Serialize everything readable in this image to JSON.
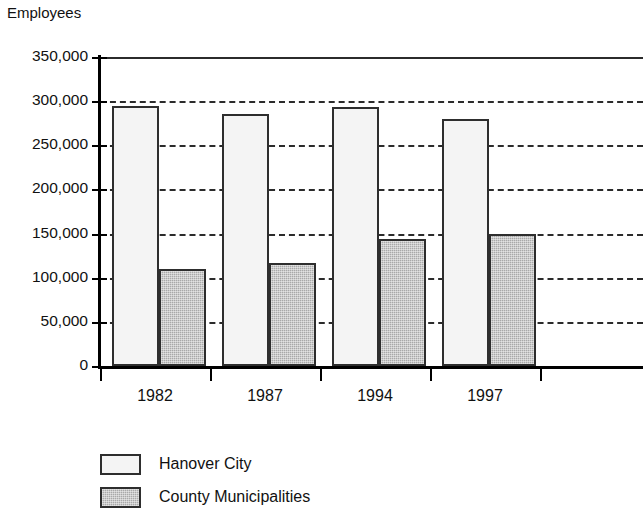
{
  "chart_data": {
    "type": "bar",
    "title": "",
    "ylabel": "Employees",
    "xlabel": "",
    "categories": [
      "1982",
      "1987",
      "1994",
      "1997"
    ],
    "series": [
      {
        "name": "Hanover City",
        "color": "#f4f4f4",
        "values": [
          295000,
          285000,
          293000,
          280000
        ]
      },
      {
        "name": "County Municipalities",
        "color": "#a9a9a9",
        "values": [
          110000,
          117000,
          144000,
          149000
        ]
      }
    ],
    "ylim": [
      0,
      350000
    ],
    "ytick_values": [
      350000,
      300000,
      250000,
      200000,
      150000,
      100000,
      50000,
      0
    ],
    "ytick_labels": [
      "350,000",
      "300,000",
      "250,000",
      "200,000",
      "150,000",
      "100,000",
      "50,000",
      "0"
    ],
    "grid": true,
    "gridline_style": "dashed",
    "legend_position": "bottom-left",
    "note": "Plot area is cropped at the right edge of the image; gridlines continue past the final bar."
  }
}
